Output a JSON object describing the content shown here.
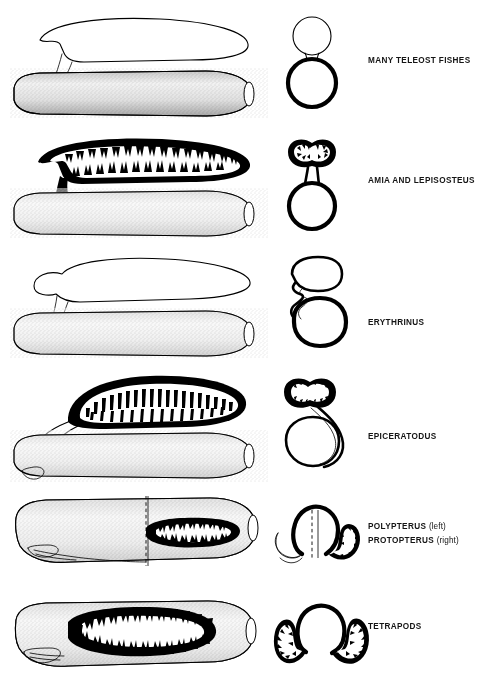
{
  "figure": {
    "background_color": "#ffffff",
    "ink_color": "#000000",
    "column_headers": {
      "lateral": "lateral view",
      "cross_section": "transverse section",
      "label": "taxon"
    }
  },
  "rows": [
    {
      "id": "row-teleosts",
      "label": "MANY TELEOST FISHES",
      "label_lines": [
        {
          "text": "MANY TELEOST FISHES",
          "side": ""
        }
      ],
      "lateral": {
        "sac_type": "smooth gas bladder, dorsal",
        "sac_wall": "thin unvascularized",
        "duct": "short pneumatic duct, dorsal attachment",
        "gut": "stippled tube"
      },
      "cross_section": {
        "shape": "figure-eight",
        "sac_position": "dorsal, midline",
        "sac_wall": "thin",
        "gut_wall": "thick"
      }
    },
    {
      "id": "row-amia-lepisosteus",
      "label": "AMIA AND LEPISOSTEUS",
      "label_lines": [
        {
          "text": "AMIA AND LEPISOSTEUS",
          "side": ""
        }
      ],
      "lateral": {
        "sac_type": "vascularized respiratory gas bladder, dorsal",
        "sac_wall": "thick alveolar with branching septa",
        "duct": "short wide duct, dorsal attachment",
        "gut": "stippled tube"
      },
      "cross_section": {
        "shape": "bilobed sac on stalk above gut",
        "sac_position": "dorsal, midline",
        "sac_wall": "thick vascularized",
        "gut_wall": "thick"
      }
    },
    {
      "id": "row-erythrinus",
      "label": "ERYTHRINUS",
      "label_lines": [
        {
          "text": "ERYTHRINUS",
          "side": ""
        }
      ],
      "lateral": {
        "sac_type": "smooth gas bladder, dorsal",
        "sac_wall": "thin",
        "duct": "elongate duct descending to lateral gut wall",
        "gut": "stippled tube"
      },
      "cross_section": {
        "shape": "rounded sac with duct curving down left side",
        "sac_position": "dorsal, shifted left",
        "sac_wall": "thin",
        "gut_wall": "thick"
      }
    },
    {
      "id": "row-epiceratodus",
      "label": "EPICERATODUS",
      "label_lines": [
        {
          "text": "EPICERATODUS",
          "side": ""
        }
      ],
      "lateral": {
        "sac_type": "dorsal lung with regular comb-like septa",
        "sac_wall": "thick with evenly spaced transverse septa",
        "duct": "long duct curving around anterior end to ventral gut",
        "gut": "stippled tube"
      },
      "cross_section": {
        "shape": "bilobed lung with long duct sweeping right and ventrally",
        "sac_position": "dorsal",
        "sac_wall": "thick vascularized",
        "gut_wall": "thick"
      }
    },
    {
      "id": "row-polypterus-protopterus",
      "label": "POLYPTERUS (left) / PROTOPTERUS (right)",
      "label_lines": [
        {
          "text": "POLYPTERUS",
          "side": "(left)"
        },
        {
          "text": "PROTOPTERUS",
          "side": "(right)"
        }
      ],
      "lateral": {
        "sac_type": "ventral lung",
        "left_half": "Polypterus — smooth unvascularized ventral sac",
        "right_half": "Protopterus — vascularized alveolar ventral lung",
        "divider": "vertical dashed midline",
        "gut": "stippled tube"
      },
      "cross_section": {
        "shape": "gut with ventral sacs flanking a dashed midline",
        "left_sac": "smooth, thin walled",
        "right_sac": "thick alveolar",
        "divider": "vertical dashed midline"
      }
    },
    {
      "id": "row-tetrapods",
      "label": "TETRAPODS",
      "label_lines": [
        {
          "text": "TETRAPODS",
          "side": ""
        }
      ],
      "lateral": {
        "sac_type": "large ventral lung with heavy alveolar walls",
        "sac_wall": "thick, densely branched alveolar tissue",
        "duct": "short ventral glottis/trachea at anterior end",
        "gut": "stippled tube"
      },
      "cross_section": {
        "shape": "central gut with paired ventrolateral alveolar lungs",
        "sac_position": "paired, ventrolateral",
        "sac_wall": "thick alveolar",
        "gut_wall": "thick"
      }
    }
  ]
}
